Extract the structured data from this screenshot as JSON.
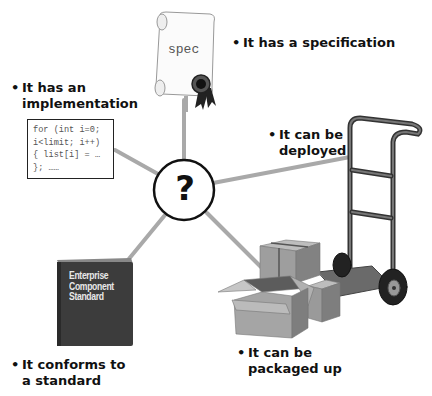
{
  "diagram": {
    "center": {
      "symbol": "?",
      "icon": "question-mark-icon"
    },
    "nodes": [
      {
        "id": "specification",
        "bullet": "•",
        "lines": [
          "It has a specification"
        ],
        "icon": "scroll-certificate-icon",
        "icon_text": "spec"
      },
      {
        "id": "implementation",
        "bullet": "•",
        "lines": [
          "It has an",
          "implementation"
        ],
        "icon": "code-snippet-icon",
        "code": [
          "for (int i=0;",
          "i<limit; i++)",
          "{ list[i] = …",
          "}; ……"
        ]
      },
      {
        "id": "deployed",
        "bullet": "•",
        "lines": [
          "It can be",
          "deployed"
        ],
        "icon": "hand-truck-icon"
      },
      {
        "id": "packaged",
        "bullet": "•",
        "lines": [
          "It can be",
          "packaged up"
        ],
        "icon": "cardboard-boxes-icon"
      },
      {
        "id": "standard",
        "bullet": "•",
        "lines": [
          "It conforms to",
          "a standard"
        ],
        "icon": "book-icon",
        "book_title": [
          "Enterprise",
          "Component",
          "Standard"
        ]
      }
    ],
    "colors": {
      "connector": "#a9a9a9",
      "text": "#111111",
      "book": "#3c3c3c",
      "box": "#9a9a9a",
      "cart": "#3a3a3a"
    }
  }
}
